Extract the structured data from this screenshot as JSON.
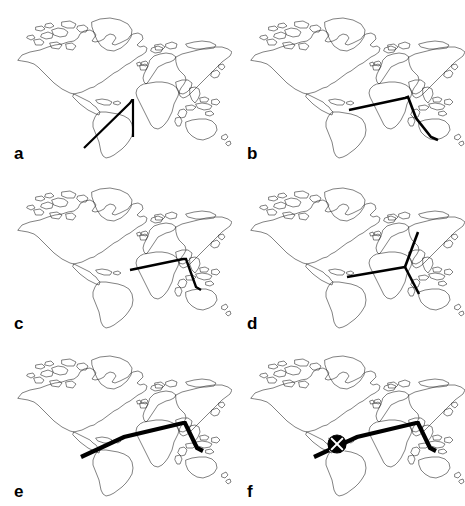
{
  "figure": {
    "type": "multi-panel-map-figure",
    "background_color": "#ffffff",
    "stroke_color": "#000000",
    "coastline_color": "#1a1a1a",
    "panel_count": 6,
    "columns": 2,
    "rows": 3,
    "width": 465,
    "height": 506
  },
  "panels": [
    {
      "id": "a",
      "label": "a",
      "position": {
        "row": 1,
        "col": 1
      },
      "route_style": {
        "width": 2.2,
        "color": "#000000"
      },
      "route_description": "V-shaped path from southern South America north-east to a vertex over West Africa, then south-east down to southern Africa",
      "route_points": [
        {
          "x": 84,
          "y": 148
        },
        {
          "x": 130,
          "y": 103
        },
        {
          "x": 132,
          "y": 100
        },
        {
          "x": 133,
          "y": 100
        },
        {
          "x": 133,
          "y": 137
        }
      ],
      "marker": null
    },
    {
      "id": "b",
      "label": "b",
      "position": {
        "row": 1,
        "col": 2
      },
      "route_style": {
        "width": 2.6,
        "color": "#000000"
      },
      "route_description": "Path from central Africa east across the Indian Ocean to a vertex near East Asia, then south-east past Australia",
      "route_points": [
        {
          "x": 116,
          "y": 110
        },
        {
          "x": 172,
          "y": 98
        },
        {
          "x": 175,
          "y": 97
        },
        {
          "x": 183,
          "y": 118
        },
        {
          "x": 198,
          "y": 137
        },
        {
          "x": 205,
          "y": 140
        }
      ],
      "marker": null
    },
    {
      "id": "c",
      "label": "c",
      "position": {
        "row": 2,
        "col": 1
      },
      "route_style": {
        "width": 2.4,
        "color": "#000000"
      },
      "route_description": "Path from central Africa east to a vertex near East Asia, then south-south-east into the Australian region",
      "route_points": [
        {
          "x": 130,
          "y": 100
        },
        {
          "x": 183,
          "y": 89
        },
        {
          "x": 186,
          "y": 89
        },
        {
          "x": 196,
          "y": 117
        },
        {
          "x": 201,
          "y": 120
        }
      ],
      "marker": null
    },
    {
      "id": "d",
      "label": "d",
      "position": {
        "row": 2,
        "col": 2
      },
      "route_style": {
        "width": 2.6,
        "color": "#000000"
      },
      "route_description": "Three-branch star centred over South-East Asia with arms reaching west to Africa, north-east to north-east Asia, and south-east to Australia",
      "hub": {
        "x": 172,
        "y": 97
      },
      "branches": [
        [
          {
            "x": 172,
            "y": 97
          },
          {
            "x": 114,
            "y": 107
          }
        ],
        [
          {
            "x": 172,
            "y": 97
          },
          {
            "x": 185,
            "y": 62
          }
        ],
        [
          {
            "x": 172,
            "y": 97
          },
          {
            "x": 186,
            "y": 124
          }
        ]
      ],
      "marker": null
    },
    {
      "id": "e",
      "label": "e",
      "position": {
        "row": 3,
        "col": 1
      },
      "route_style": {
        "width": 4.2,
        "color": "#000000"
      },
      "route_description": "Thick path from north-western South America east across the Atlantic and Africa to a vertex in East Asia, then south-east to Australia",
      "route_points": [
        {
          "x": 81,
          "y": 119
        },
        {
          "x": 124,
          "y": 99
        },
        {
          "x": 183,
          "y": 85
        },
        {
          "x": 185,
          "y": 85
        },
        {
          "x": 197,
          "y": 110
        },
        {
          "x": 203,
          "y": 113
        }
      ],
      "marker": null
    },
    {
      "id": "f",
      "label": "f",
      "position": {
        "row": 3,
        "col": 2
      },
      "route_style": {
        "width": 4.2,
        "color": "#000000"
      },
      "route_description": "Thick path identical to panel e with a circular crossed node marker placed over north-west Africa",
      "route_points": [
        {
          "x": 81,
          "y": 119
        },
        {
          "x": 124,
          "y": 99
        },
        {
          "x": 183,
          "y": 85
        },
        {
          "x": 185,
          "y": 85
        },
        {
          "x": 197,
          "y": 110
        },
        {
          "x": 203,
          "y": 113
        }
      ],
      "marker": {
        "shape": "crossed-circle-node",
        "x": 104,
        "y": 106,
        "radius": 9,
        "fill": "#000000",
        "cut_color": "#ffffff",
        "description": "Filled black disc divided by a white X into four wedges"
      }
    }
  ],
  "labels": {
    "a": "a",
    "b": "b",
    "c": "c",
    "d": "d",
    "e": "e",
    "f": "f"
  }
}
